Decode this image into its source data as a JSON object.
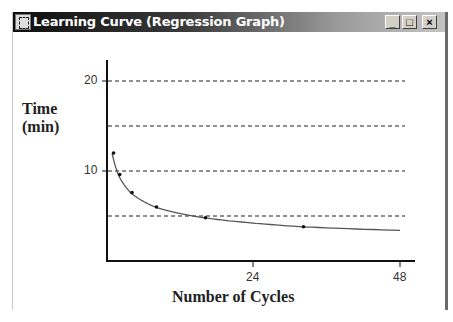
{
  "window": {
    "title": "Learning Curve (Regression Graph)",
    "buttons": {
      "minimize": "_",
      "maximize": "□",
      "close": "×"
    }
  },
  "chart_data": {
    "type": "line",
    "title": "",
    "xlabel": "Number of Cycles",
    "ylabel": "Time (min)",
    "ylabel_lines": [
      "Time",
      "(min)"
    ],
    "xlim": [
      0,
      50
    ],
    "ylim": [
      0,
      22
    ],
    "x_ticks": [
      24,
      48
    ],
    "x_tick_labels": [
      "24",
      "48"
    ],
    "y_ticks": [
      10,
      20
    ],
    "y_tick_labels": [
      "10",
      "20"
    ],
    "gridlines_y": [
      5,
      10,
      15,
      20
    ],
    "grid": "horizontal dashed",
    "legend": null,
    "series": [
      {
        "name": "Observed",
        "type": "scatter",
        "x": [
          1,
          2,
          4,
          8,
          16,
          32
        ],
        "y": [
          12.0,
          9.6,
          7.6,
          6.0,
          4.8,
          3.8
        ]
      },
      {
        "name": "Regression curve",
        "type": "line",
        "x": [
          1,
          2,
          4,
          8,
          16,
          32,
          48
        ],
        "y": [
          12.0,
          9.6,
          7.6,
          6.0,
          4.8,
          3.8,
          3.4
        ]
      }
    ]
  }
}
